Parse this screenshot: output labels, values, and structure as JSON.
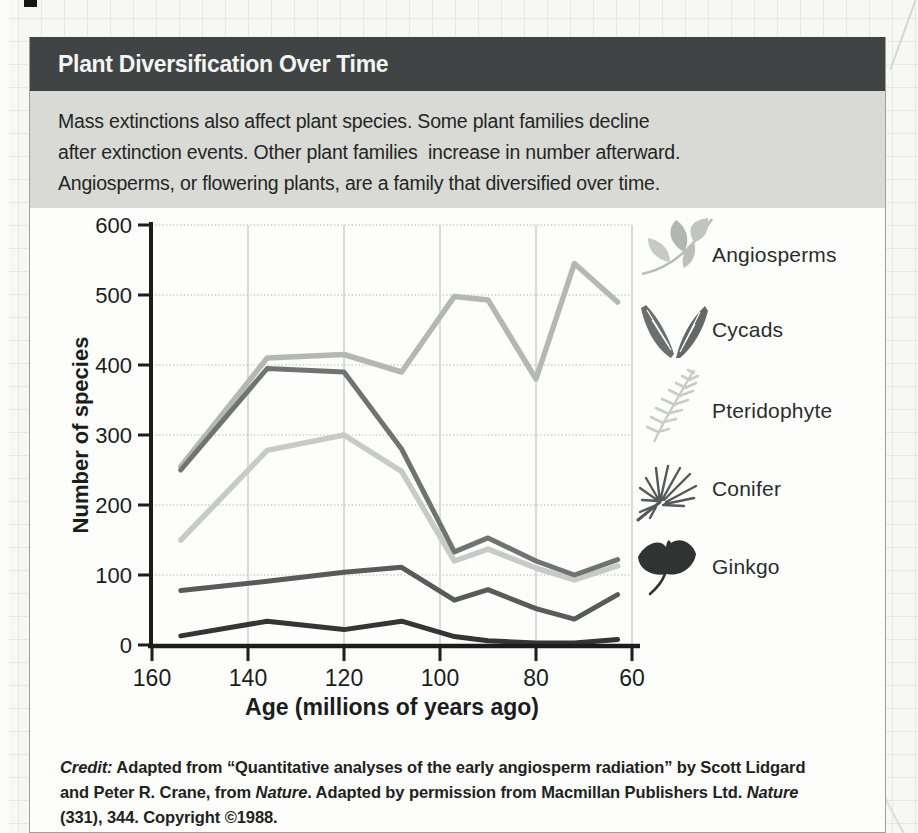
{
  "header": {
    "title": "Plant Diversification Over Time"
  },
  "description": {
    "lines": [
      "Mass extinctions also affect plant species. Some plant families decline",
      "after extinction events. Other plant families  increase in number afterward.",
      "Angiosperms, or flowering plants, are a family that diversified over time."
    ]
  },
  "chart_data": {
    "type": "line",
    "title": "Plant Diversification Over Time",
    "xlabel": "Age (millions of years ago)",
    "ylabel": "Number of species",
    "xlim": [
      160,
      60
    ],
    "ylim": [
      0,
      600
    ],
    "x_axis_reversed": true,
    "grid": true,
    "legend_position": "right",
    "x_ticks": [
      160,
      140,
      120,
      100,
      80,
      60
    ],
    "y_ticks": [
      0,
      100,
      200,
      300,
      400,
      500,
      600
    ],
    "x": [
      154,
      136,
      120,
      108,
      97,
      90,
      80,
      72,
      63
    ],
    "series": [
      {
        "name": "Angiosperms",
        "color": "#b4b8b4",
        "width": 5.5,
        "values": [
          255,
          410,
          415,
          390,
          498,
          493,
          380,
          545,
          490
        ]
      },
      {
        "name": "Pteridophyte",
        "color": "#c7cbc7",
        "width": 5.5,
        "values": [
          150,
          278,
          300,
          248,
          120,
          137,
          110,
          93,
          113
        ]
      },
      {
        "name": "Cycads",
        "color": "#6f7472",
        "width": 5,
        "values": [
          250,
          395,
          390,
          280,
          133,
          153,
          120,
          100,
          122
        ]
      },
      {
        "name": "Conifer",
        "color": "#575c5a",
        "width": 5,
        "values": [
          78,
          91,
          104,
          111,
          64,
          79,
          52,
          37,
          72
        ]
      },
      {
        "name": "Ginkgo",
        "color": "#323635",
        "width": 5,
        "values": [
          13,
          34,
          22,
          34,
          12,
          6,
          3,
          3,
          8
        ]
      }
    ]
  },
  "legend": {
    "items": [
      {
        "label": "Angiosperms",
        "icon": "angiosperms-icon",
        "color": "#b4b8b4"
      },
      {
        "label": "Cycads",
        "icon": "cycads-icon",
        "color": "#6f7472"
      },
      {
        "label": "Pteridophyte",
        "icon": "pteridophyte-icon",
        "color": "#c7cbc7"
      },
      {
        "label": "Conifer",
        "icon": "conifer-icon",
        "color": "#575c5a"
      },
      {
        "label": "Ginkgo",
        "icon": "ginkgo-icon",
        "color": "#323635"
      }
    ]
  },
  "credit": {
    "lines": [
      [
        {
          "t": "Credit:",
          "style": "bold-italic"
        },
        {
          "t": " Adapted from “Quantitative analyses of the early angiosperm radiation” by Scott Lidgard",
          "style": "bold"
        }
      ],
      [
        {
          "t": "and Peter R. Crane, from ",
          "style": "bold"
        },
        {
          "t": "Nature",
          "style": "bold-italic"
        },
        {
          "t": ". Adapted by permission from Macmillan Publishers Ltd. ",
          "style": "bold"
        },
        {
          "t": "Nature",
          "style": "bold-italic"
        }
      ],
      [
        {
          "t": "(331), 344. Copyright ©1988.",
          "style": "bold"
        }
      ]
    ]
  },
  "colors": {
    "header_bar": "#404445",
    "description_panel": "#d9dad6",
    "axis": "#1b1d1d",
    "grid_horizontal": "#b6bab6",
    "grid_vertical": "#c3c7c3",
    "paper_background": "#f7f7f4",
    "card_background": "#fdfdfc"
  }
}
